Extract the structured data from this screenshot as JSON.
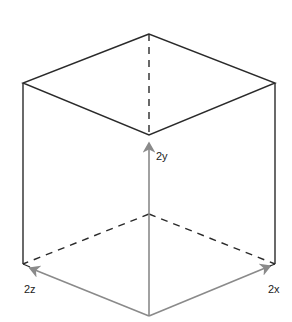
{
  "diagram": {
    "type": "isometric-cube",
    "labels": {
      "y": "2y",
      "z": "2z",
      "x": "2x"
    },
    "colors": {
      "edge": "#2a2a2a",
      "hidden_edge": "#2a2a2a",
      "axis_arrow": "#8a8a8a",
      "background": "#ffffff"
    },
    "vertices": {
      "top_back": [
        149,
        34
      ],
      "top_left": [
        23,
        83
      ],
      "top_right": [
        275,
        83
      ],
      "top_front": [
        149,
        135
      ],
      "bottom_back": [
        149,
        214
      ],
      "bottom_left": [
        23,
        264
      ],
      "bottom_right": [
        275,
        264
      ],
      "bottom_front": [
        149,
        316
      ]
    }
  }
}
